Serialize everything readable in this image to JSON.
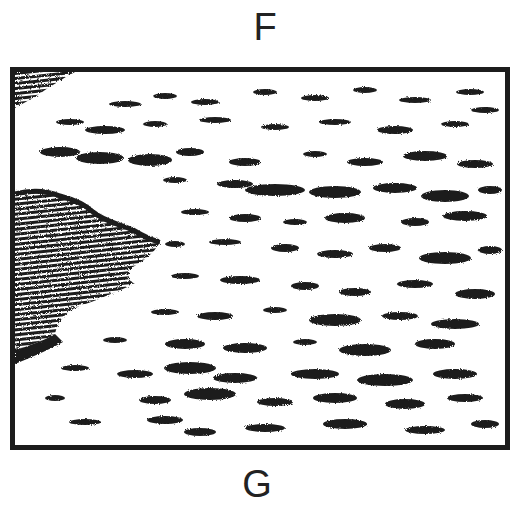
{
  "labels": {
    "top": "F",
    "bottom": "G"
  },
  "illustration": {
    "subject": "ink sketch of sea waves with a dark shoreline on the left",
    "ink_color": "#1c1c1c",
    "paper_color": "#ffffff"
  }
}
